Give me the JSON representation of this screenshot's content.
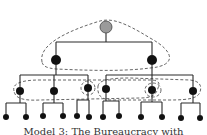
{
  "diagram": {
    "caption": "Model 3: The Bureaucracy with",
    "colors": {
      "edge": "#2a2a2a",
      "node": "#111111",
      "root_fill": "#9a9a9a",
      "dashed_group": "#555555",
      "background": "#ffffff"
    },
    "nodes": [
      {
        "id": "root",
        "level": 0,
        "x": 106,
        "y": 27,
        "r": 6,
        "style": "gray"
      },
      {
        "id": "a",
        "level": 1,
        "x": 56,
        "y": 60,
        "r": 5,
        "style": "black"
      },
      {
        "id": "b",
        "level": 1,
        "x": 152,
        "y": 60,
        "r": 5,
        "style": "black"
      },
      {
        "id": "a1",
        "level": 2,
        "x": 20,
        "y": 91,
        "r": 4,
        "style": "black"
      },
      {
        "id": "a2",
        "level": 2,
        "x": 54,
        "y": 91,
        "r": 4,
        "style": "black"
      },
      {
        "id": "a3",
        "level": 2,
        "x": 88,
        "y": 88,
        "r": 4,
        "style": "black"
      },
      {
        "id": "b1",
        "level": 2,
        "x": 106,
        "y": 89,
        "r": 4,
        "style": "black"
      },
      {
        "id": "b2",
        "level": 2,
        "x": 152,
        "y": 90,
        "r": 4,
        "style": "black"
      },
      {
        "id": "b3",
        "level": 2,
        "x": 193,
        "y": 91,
        "r": 4,
        "style": "black"
      },
      {
        "id": "a1l",
        "level": 3,
        "x": 6,
        "y": 117,
        "r": 3
      },
      {
        "id": "a1r",
        "level": 3,
        "x": 26,
        "y": 117,
        "r": 3
      },
      {
        "id": "a2l",
        "level": 3,
        "x": 43,
        "y": 116,
        "r": 3
      },
      {
        "id": "a2r",
        "level": 3,
        "x": 63,
        "y": 116,
        "r": 3
      },
      {
        "id": "a3l",
        "level": 3,
        "x": 77,
        "y": 116,
        "r": 3
      },
      {
        "id": "a3r",
        "level": 3,
        "x": 89,
        "y": 117,
        "r": 3
      },
      {
        "id": "b1l",
        "level": 3,
        "x": 103,
        "y": 117,
        "r": 3
      },
      {
        "id": "b1r",
        "level": 3,
        "x": 119,
        "y": 116,
        "r": 3
      },
      {
        "id": "b2l",
        "level": 3,
        "x": 141,
        "y": 117,
        "r": 3
      },
      {
        "id": "b2r",
        "level": 3,
        "x": 162,
        "y": 117,
        "r": 3
      },
      {
        "id": "b3l",
        "level": 3,
        "x": 181,
        "y": 118,
        "r": 3
      },
      {
        "id": "b3r",
        "level": 3,
        "x": 200,
        "y": 118,
        "r": 3
      }
    ],
    "edges": [
      [
        "root",
        "a"
      ],
      [
        "root",
        "b"
      ],
      [
        "a",
        "a1"
      ],
      [
        "a",
        "a2"
      ],
      [
        "a",
        "a3"
      ],
      [
        "b",
        "b1"
      ],
      [
        "b",
        "b2"
      ],
      [
        "b",
        "b3"
      ],
      [
        "a1",
        "a1l"
      ],
      [
        "a1",
        "a1r"
      ],
      [
        "a2",
        "a2l"
      ],
      [
        "a2",
        "a2r"
      ],
      [
        "a3",
        "a3l"
      ],
      [
        "a3",
        "a3r"
      ],
      [
        "b1",
        "b1l"
      ],
      [
        "b1",
        "b1r"
      ],
      [
        "b2",
        "b2l"
      ],
      [
        "b2",
        "b2r"
      ],
      [
        "b3",
        "b3l"
      ],
      [
        "b3",
        "b3r"
      ]
    ],
    "groups": [
      {
        "name": "top-group",
        "members": [
          "root",
          "a",
          "b"
        ]
      },
      {
        "name": "left-cross-group",
        "members": [
          "a1",
          "b1",
          "b2"
        ]
      },
      {
        "name": "right-cross-group",
        "members": [
          "a3",
          "b1",
          "b3"
        ]
      },
      {
        "name": "a3-local-group",
        "members": [
          "a3"
        ]
      },
      {
        "name": "b2-local-group",
        "members": [
          "b2"
        ]
      }
    ]
  }
}
